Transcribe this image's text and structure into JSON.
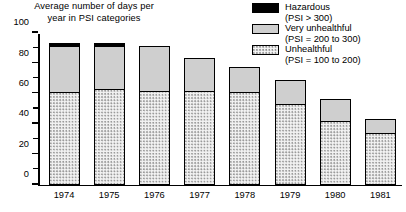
{
  "chart_data": {
    "type": "bar",
    "subtype": "stacked-bar",
    "title": "Average number of days per\nyear in PSI categories",
    "xlabel": "",
    "ylabel": "",
    "ylim": [
      0,
      100
    ],
    "grid": false,
    "legend_position": "top-right",
    "categories": [
      "1974",
      "1975",
      "1976",
      "1977",
      "1978",
      "1979",
      "1980",
      "1981"
    ],
    "y_ticks_major": [
      0,
      20,
      40,
      60,
      80,
      100
    ],
    "y_ticks_minor": [
      10,
      30,
      50,
      70,
      90
    ],
    "series": [
      {
        "name": "Unhealthful",
        "sublabel": "(PSI = 100 to 200)",
        "swatch": "unhealthful-dotted",
        "values": [
          61,
          63,
          62,
          62,
          61,
          53,
          42,
          34
        ]
      },
      {
        "name": "Very unhealthful",
        "sublabel": "(PSI = 200 to 300)",
        "swatch": "very-unhealthful-gray",
        "values": [
          30,
          28,
          29,
          21,
          16,
          16,
          14,
          9
        ]
      },
      {
        "name": "Hazardous",
        "sublabel": "(PSI > 300)",
        "swatch": "hazardous-black",
        "values": [
          2,
          1.5,
          0,
          0,
          0,
          0,
          0,
          0
        ]
      }
    ],
    "totals": [
      93,
      92.5,
      91,
      83,
      77,
      69,
      56,
      43
    ]
  },
  "legend": {
    "items": [
      {
        "label": "Hazardous",
        "sublabel": "(PSI > 300)",
        "swatch": "hazardous-black"
      },
      {
        "label": "Very unhealthful",
        "sublabel": "(PSI = 200 to 300)",
        "swatch": "very-unhealthful-gray"
      },
      {
        "label": "Unhealthful",
        "sublabel": "(PSI = 100 to 200)",
        "swatch": "unhealthful-dotted"
      }
    ]
  },
  "colors": {
    "axis": "#000000",
    "hazardous": "#000000",
    "very_unhealthful": "#cfcfcf",
    "unhealthful_fill": "#f2f2f2",
    "unhealthful_dots": "#9a9a9a",
    "background": "#ffffff"
  }
}
